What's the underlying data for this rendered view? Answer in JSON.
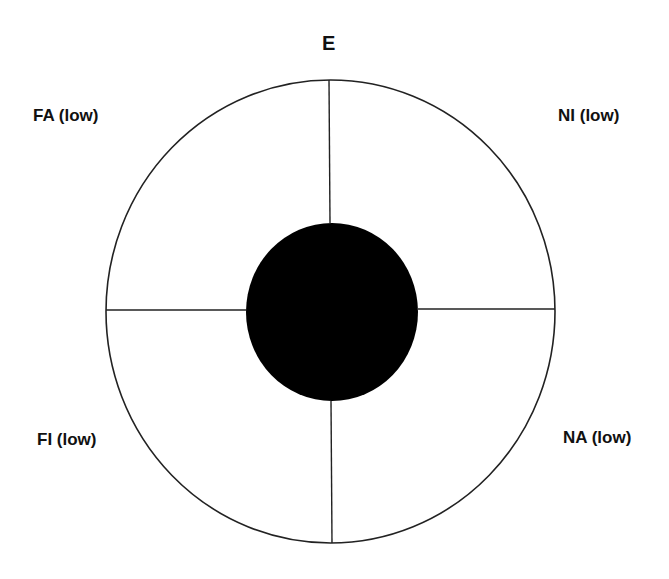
{
  "diagram": {
    "type": "circular-quadrant-diagram",
    "center_label": "",
    "top_label": "E",
    "quadrant_labels": {
      "top_left": "FA (low)",
      "top_right": "NI (low)",
      "bottom_left": "FI (low)",
      "bottom_right": "NA (low)"
    },
    "colors": {
      "background": "#ffffff",
      "outline": "#222222",
      "center_fill": "#000000",
      "text": "#111111"
    }
  }
}
